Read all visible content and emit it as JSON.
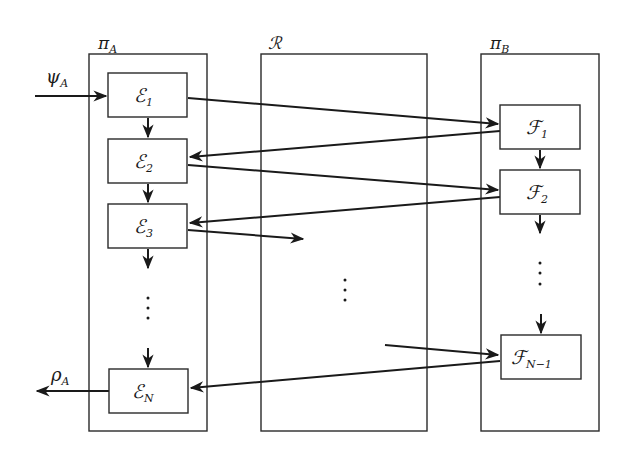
{
  "containers": [
    {
      "id": "piA",
      "label": "π",
      "sub": "A"
    },
    {
      "id": "R",
      "label": "ℛ",
      "sub": ""
    },
    {
      "id": "piB",
      "label": "π",
      "sub": "B"
    }
  ],
  "nodes": {
    "E1": {
      "label": "ℰ",
      "sub": "1"
    },
    "E2": {
      "label": "ℰ",
      "sub": "2"
    },
    "E3": {
      "label": "ℰ",
      "sub": "3"
    },
    "EN": {
      "label": "ℰ",
      "sub": "N"
    },
    "F1": {
      "label": "ℱ",
      "sub": "1"
    },
    "F2": {
      "label": "ℱ",
      "sub": "2"
    },
    "FN1": {
      "label": "ℱ",
      "sub": "N−1"
    }
  },
  "io": {
    "input": {
      "label": "ψ",
      "sub": "A"
    },
    "output": {
      "label": "ρ",
      "sub": "A"
    }
  },
  "ellipsis": "⋮",
  "edges": [
    {
      "from": "input",
      "to": "E1"
    },
    {
      "from": "E1",
      "to": "E2"
    },
    {
      "from": "E2",
      "to": "E3"
    },
    {
      "from": "E3",
      "to": "ellipsis-A"
    },
    {
      "from": "ellipsis-A",
      "to": "EN"
    },
    {
      "from": "EN",
      "to": "output"
    },
    {
      "from": "E1",
      "to": "F1"
    },
    {
      "from": "F1",
      "to": "E2"
    },
    {
      "from": "E2",
      "to": "F2"
    },
    {
      "from": "F2",
      "to": "E3"
    },
    {
      "from": "E3",
      "to": "R"
    },
    {
      "from": "F1",
      "to": "F2"
    },
    {
      "from": "F2",
      "to": "ellipsis-B"
    },
    {
      "from": "ellipsis-B",
      "to": "FN1"
    },
    {
      "from": "R",
      "to": "FN1"
    },
    {
      "from": "FN1",
      "to": "EN"
    }
  ]
}
